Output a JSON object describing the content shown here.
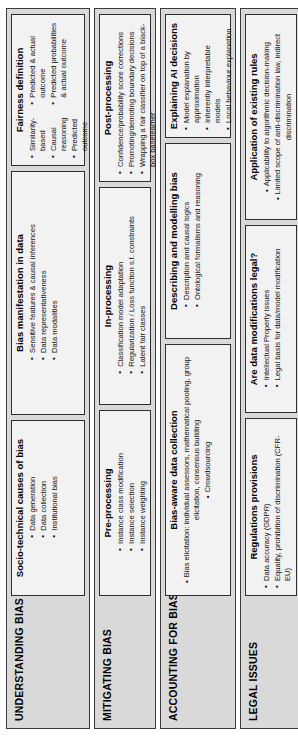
{
  "figure": {
    "orientation": "rotated-90-ccw",
    "sections": [
      {
        "title": "UNDERSTANDING BIAS",
        "cards": [
          {
            "title": "Socio-technical causes of bias",
            "columns": [
              {
                "bullets": [
                  "Data generation",
                  "Data collection",
                  "Institutional bias"
                ]
              }
            ]
          },
          {
            "title": "Bias manifestation in data",
            "columns": [
              {
                "bullets": [
                  "Sensitive features & causal inferences",
                  "Data representativeness",
                  "Data modalities"
                ]
              }
            ]
          },
          {
            "title": "Fairness definition",
            "columns": [
              {
                "bullets": [
                  "Similarity-based",
                  "Causal reasoning",
                  "Predicted outcome"
                ]
              },
              {
                "bullets": [
                  "Predicted & actual outcome",
                  "Predicted probabilities & actual outcome"
                ]
              }
            ]
          }
        ]
      },
      {
        "title": "MITIGATING BIAS",
        "cards": [
          {
            "title": "Pre-processing",
            "columns": [
              {
                "bullets": [
                  "Instance class modification",
                  "Instance selection",
                  "Instance weighting"
                ]
              }
            ]
          },
          {
            "title": "In-processing",
            "columns": [
              {
                "bullets": [
                  "Classification model adaptation",
                  "Regularization / Loss function s.t. constraints",
                  "Latent fair classes"
                ]
              }
            ]
          },
          {
            "title": "Post-processing",
            "columns": [
              {
                "bullets": [
                  "Confidence/probability score corrections",
                  "Promoting/demoting boundary decisions",
                  "Wrapping a fair classifier on top of a black-box baselearner"
                ]
              }
            ]
          }
        ]
      },
      {
        "title": "ACCOUNTING FOR BIAS",
        "cards": [
          {
            "title": "Bias-aware data collection",
            "columns": [
              {
                "bullets": [
                  "Bias elicitation: individual assessors, mathematical pooling, group elicitation, consensus building",
                  "Crowdsourcing"
                ]
              }
            ]
          },
          {
            "title": "Describing and modelling bias",
            "columns": [
              {
                "bullets": [
                  "Description and causal logics",
                  "Ontological formalisms and reasoning"
                ]
              }
            ]
          },
          {
            "title": "Explaining AI decisions",
            "columns": [
              {
                "bullets": [
                  "Model explanation by approximation",
                  "Inherently interpretable models",
                  "Local behaviour explanation"
                ]
              }
            ]
          }
        ]
      },
      {
        "title": "LEGAL ISSUES",
        "cards": [
          {
            "title": "Regulations provisions",
            "columns": [
              {
                "bullets": [
                  "Data accuracy (GDPR)",
                  "Equality, prohibition of discrimination (CFR-EU)"
                ]
              }
            ]
          },
          {
            "title": "Are data modifications legal?",
            "columns": [
              {
                "bullets": [
                  "Intellectual Property issues",
                  "Legal basis for data/model modification"
                ]
              }
            ]
          },
          {
            "title": "Application of existing rules",
            "columns": [
              {
                "bullets": [
                  "Applicability to algorithmic decision-making",
                  "Limited scope of anti-discrimination law, indirect discrimination"
                ]
              }
            ]
          }
        ]
      }
    ]
  },
  "colors": {
    "panel_background": "#d9d9d9",
    "card_background": "#f2f2f2",
    "border": "#2f2f2f",
    "text": "#000000",
    "page_background": "#ffffff"
  }
}
